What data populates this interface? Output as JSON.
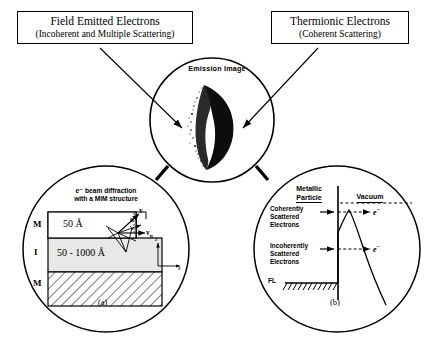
{
  "figure": {
    "caption_a": "(a)",
    "caption_b": "(b)"
  },
  "callouts": {
    "left": {
      "title": "Field Emitted Electrons",
      "subtitle": "(Incoherent and Multiple Scattering)"
    },
    "right": {
      "title": "Thermionic Electrons",
      "subtitle": "(Coherent Scattering)"
    }
  },
  "center": {
    "title": "Emission Image"
  },
  "panel_a": {
    "title_line1": "e⁻ beam diffraction",
    "title_line2": "with a MIM structure",
    "layers": [
      {
        "label": "M",
        "thickness": "50 Å"
      },
      {
        "label": "I",
        "thickness": "50 - 1000 Å"
      },
      {
        "label": "M",
        "thickness": ""
      }
    ],
    "vectors": {
      "v": "v",
      "v_parallel": "v",
      "v_parallel_sub": "n",
      "theta": "θ"
    },
    "axes": {
      "z": "z",
      "x": "x"
    }
  },
  "panel_b": {
    "header_left_line1": "Metallic",
    "header_left_line2": "Particle",
    "header_right": "Vacuum",
    "group_coherent": [
      "Coherently",
      "Scattered",
      "Electrons"
    ],
    "group_incoherent": [
      "Incoherently",
      "Scattered",
      "Electrons"
    ],
    "electron_label_top": "e",
    "electron_label_top_sup": "−",
    "electron_label_bottom": "e",
    "electron_label_bottom_sup": "−",
    "fermi_level": "FL"
  },
  "colors": {
    "ink": "#000000",
    "paper": "#ffffff",
    "insulator_fill": "#e8e8e8"
  }
}
